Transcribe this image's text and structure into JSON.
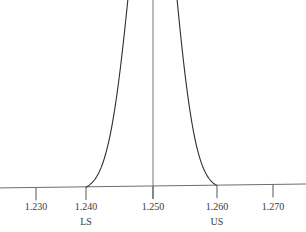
{
  "chart_data": {
    "type": "line",
    "title": "",
    "xlabel": "",
    "ylabel": "",
    "mean": 1.25,
    "std_dev_estimate": 0.0033,
    "xlim": [
      1.222,
      1.277
    ],
    "x_ticks": [
      1.23,
      1.24,
      1.25,
      1.26,
      1.27
    ],
    "x_tick_labels": [
      "1.230",
      "1.240",
      "1.250",
      "1.260",
      "1.270"
    ],
    "spec_limits": [
      {
        "name": "LS",
        "value": 1.24
      },
      {
        "name": "US",
        "value": 1.26
      }
    ],
    "center_line": 1.25,
    "curve_clipped_at_top": true,
    "grid": false,
    "legend": "none"
  }
}
